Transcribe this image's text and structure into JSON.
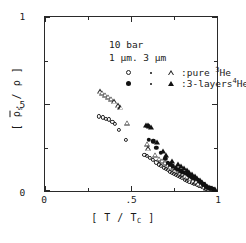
{
  "figure": {
    "background": "#ffffff",
    "ink_color": "#1a1a1a"
  },
  "annotations": {
    "pressure": "10 bar",
    "thickness": "1 µm. 3 µm"
  },
  "legend": {
    "row1": {
      "symbols": [
        "open-circle",
        "small-dot",
        "open-triangle"
      ],
      "label": ":pure ³He"
    },
    "row2": {
      "symbols": [
        "filled-circle",
        "small-dot",
        "filled-triangle"
      ],
      "label": ":3-layers⁴He"
    }
  },
  "axes": {
    "x_title": "[ T / T_C ]",
    "y_title": "[ ρ̅_s / ρ ]",
    "x_ticks": [
      "0",
      ".5",
      "1"
    ],
    "y_ticks": [
      "0",
      ".5",
      "1"
    ]
  },
  "chart_data": {
    "type": "scatter",
    "title": "",
    "xlabel": "[ T / T_C ]",
    "ylabel": "[ rho_s_bar / rho ]",
    "xlim": [
      0,
      1
    ],
    "ylim": [
      0,
      1
    ],
    "xticks": [
      0,
      0.5,
      1
    ],
    "yticks": [
      0,
      0.5,
      1
    ],
    "xminorticks": [
      0.25,
      0.75
    ],
    "yminorticks": [
      0.25,
      0.75
    ],
    "grid": false,
    "legend_position": "upper-left-inside",
    "series": [
      {
        "name": "pure 3He, 1 um (open circles)",
        "marker": "open-circle",
        "points": [
          [
            0.315,
            0.425
          ],
          [
            0.335,
            0.42
          ],
          [
            0.355,
            0.412
          ],
          [
            0.372,
            0.408
          ],
          [
            0.392,
            0.395
          ],
          [
            0.408,
            0.38
          ],
          [
            0.432,
            0.345
          ],
          [
            0.468,
            0.29
          ],
          [
            0.578,
            0.205
          ],
          [
            0.592,
            0.196
          ],
          [
            0.612,
            0.186
          ],
          [
            0.628,
            0.176
          ],
          [
            0.648,
            0.16
          ],
          [
            0.662,
            0.148
          ],
          [
            0.676,
            0.14
          ],
          [
            0.69,
            0.13
          ],
          [
            0.702,
            0.122
          ],
          [
            0.714,
            0.114
          ],
          [
            0.726,
            0.106
          ],
          [
            0.738,
            0.1
          ],
          [
            0.75,
            0.095
          ],
          [
            0.762,
            0.088
          ],
          [
            0.774,
            0.08
          ],
          [
            0.786,
            0.074
          ],
          [
            0.798,
            0.068
          ],
          [
            0.812,
            0.06
          ],
          [
            0.826,
            0.054
          ],
          [
            0.84,
            0.046
          ],
          [
            0.854,
            0.04
          ],
          [
            0.868,
            0.034
          ],
          [
            0.882,
            0.028
          ],
          [
            0.896,
            0.022
          ],
          [
            0.91,
            0.016
          ],
          [
            0.924,
            0.012
          ],
          [
            0.938,
            0.008
          ],
          [
            0.952,
            0.006
          ]
        ]
      },
      {
        "name": "pure 3He, 3 um (open triangles)",
        "marker": "open-triangle",
        "points": [
          [
            0.318,
            0.57
          ],
          [
            0.334,
            0.562
          ],
          [
            0.352,
            0.552
          ],
          [
            0.368,
            0.54
          ],
          [
            0.386,
            0.528
          ],
          [
            0.404,
            0.512
          ],
          [
            0.424,
            0.49
          ],
          [
            0.44,
            0.478
          ],
          [
            0.48,
            0.39
          ],
          [
            0.592,
            0.268
          ],
          [
            0.6,
            0.24
          ],
          [
            0.64,
            0.205
          ],
          [
            0.662,
            0.18
          ],
          [
            0.682,
            0.17
          ],
          [
            0.7,
            0.158
          ],
          [
            0.716,
            0.148
          ],
          [
            0.73,
            0.138
          ],
          [
            0.744,
            0.13
          ],
          [
            0.758,
            0.12
          ],
          [
            0.772,
            0.112
          ],
          [
            0.786,
            0.104
          ],
          [
            0.8,
            0.094
          ],
          [
            0.814,
            0.086
          ],
          [
            0.828,
            0.076
          ],
          [
            0.844,
            0.068
          ],
          [
            0.86,
            0.058
          ],
          [
            0.876,
            0.048
          ],
          [
            0.892,
            0.04
          ],
          [
            0.908,
            0.03
          ],
          [
            0.924,
            0.022
          ],
          [
            0.94,
            0.014
          ],
          [
            0.956,
            0.008
          ]
        ]
      },
      {
        "name": "3-layers 4He, 1 um (filled circles/squares)",
        "marker": "filled-circle",
        "points": [
          [
            0.598,
            0.372
          ],
          [
            0.604,
            0.29
          ],
          [
            0.63,
            0.282
          ],
          [
            0.648,
            0.245
          ],
          [
            0.672,
            0.215
          ],
          [
            0.7,
            0.182
          ],
          [
            0.714,
            0.158
          ],
          [
            0.728,
            0.148
          ],
          [
            0.744,
            0.138
          ],
          [
            0.76,
            0.126
          ],
          [
            0.776,
            0.118
          ],
          [
            0.792,
            0.108
          ],
          [
            0.808,
            0.1
          ],
          [
            0.824,
            0.092
          ],
          [
            0.84,
            0.082
          ],
          [
            0.856,
            0.074
          ],
          [
            0.872,
            0.066
          ],
          [
            0.888,
            0.058
          ],
          [
            0.904,
            0.046
          ],
          [
            0.92,
            0.034
          ],
          [
            0.936,
            0.022
          ],
          [
            0.95,
            0.014
          ],
          [
            0.962,
            0.01
          ],
          [
            0.974,
            0.006
          ]
        ]
      },
      {
        "name": "3-layers 4He, 3 um (filled triangles)",
        "marker": "filled-triangle",
        "points": [
          [
            0.588,
            0.378
          ],
          [
            0.596,
            0.374
          ],
          [
            0.606,
            0.37
          ],
          [
            0.618,
            0.366
          ],
          [
            0.65,
            0.28
          ],
          [
            0.688,
            0.228
          ],
          [
            0.706,
            0.205
          ],
          [
            0.736,
            0.17
          ],
          [
            0.776,
            0.15
          ],
          [
            0.792,
            0.14
          ],
          [
            0.808,
            0.13
          ],
          [
            0.824,
            0.118
          ],
          [
            0.838,
            0.106
          ],
          [
            0.854,
            0.094
          ],
          [
            0.87,
            0.082
          ],
          [
            0.886,
            0.07
          ],
          [
            0.9,
            0.058
          ],
          [
            0.914,
            0.046
          ],
          [
            0.928,
            0.034
          ],
          [
            0.942,
            0.024
          ],
          [
            0.956,
            0.016
          ],
          [
            0.968,
            0.01
          ],
          [
            0.98,
            0.006
          ],
          [
            0.99,
            0.004
          ]
        ]
      }
    ]
  }
}
